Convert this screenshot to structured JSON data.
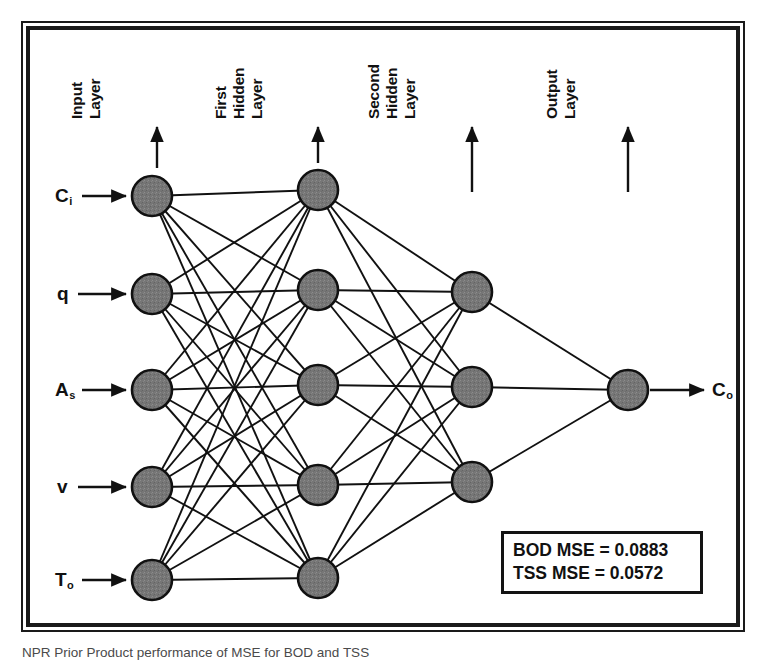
{
  "figure": {
    "kind": "neural-network-architecture-diagram",
    "frame_color": "#1a1a1a",
    "background": "#ffffff",
    "node_fill": "#767676",
    "node_stroke": "#111111",
    "edge_color": "#111111",
    "caption": "NPR Prior Product performance of MSE for BOD and TSS"
  },
  "layer_labels": [
    {
      "id": "input-layer",
      "lines": [
        "Input",
        "Layer"
      ]
    },
    {
      "id": "first-hidden-layer",
      "lines": [
        "First",
        "Hidden",
        "Layer"
      ]
    },
    {
      "id": "second-hidden-layer",
      "lines": [
        "Second",
        "Hidden",
        "Layer"
      ]
    },
    {
      "id": "output-layer",
      "lines": [
        "Output",
        "Layer"
      ]
    }
  ],
  "inputs": [
    {
      "id": "input-ci",
      "symbol": "C",
      "sub": "i"
    },
    {
      "id": "input-q",
      "symbol": "q",
      "sub": ""
    },
    {
      "id": "input-as",
      "symbol": "A",
      "sub": "s"
    },
    {
      "id": "input-v",
      "symbol": "v",
      "sub": ""
    },
    {
      "id": "input-to",
      "symbol": "T",
      "sub": "o"
    }
  ],
  "output": {
    "id": "output-co",
    "symbol": "C",
    "sub": "o"
  },
  "architecture": {
    "layers": [
      {
        "name": "Input Layer",
        "node_count": 5
      },
      {
        "name": "First Hidden Layer",
        "node_count": 5
      },
      {
        "name": "Second Hidden Layer",
        "node_count": 3
      },
      {
        "name": "Output Layer",
        "node_count": 1
      }
    ],
    "connections": "fully-connected"
  },
  "metrics": {
    "bod_label": "BOD MSE = 0.0883",
    "tss_label": "TSS MSE = 0.0572",
    "bod_value": 0.0883,
    "tss_value": 0.0572
  },
  "geometry": {
    "node_radius": 20,
    "columns_x": [
      152,
      318,
      472,
      628
    ],
    "input_y": [
      196,
      294,
      390,
      487,
      580
    ],
    "hidden1_y": [
      190,
      290,
      385,
      485,
      578
    ],
    "hidden2_y": [
      292,
      387,
      482
    ],
    "output_y": [
      390
    ]
  }
}
